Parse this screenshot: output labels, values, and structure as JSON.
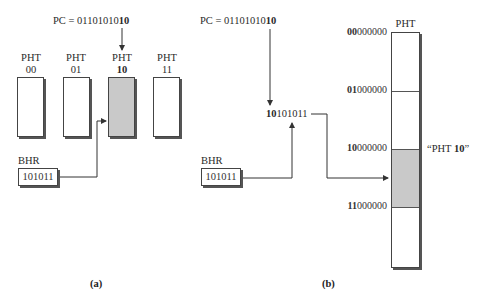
{
  "panel_a": {
    "pc": {
      "prefix": "PC = 01101010",
      "suffix_bold": "10"
    },
    "pht_tables": [
      {
        "label_top": "PHT",
        "label_bottom": "00",
        "bold": false,
        "selected": false
      },
      {
        "label_top": "PHT",
        "label_bottom": "01",
        "bold": false,
        "selected": false
      },
      {
        "label_top": "PHT",
        "label_bottom": "10",
        "bold": true,
        "selected": true
      },
      {
        "label_top": "PHT",
        "label_bottom": "11",
        "bold": false,
        "selected": false
      }
    ],
    "bhr": {
      "label": "BHR",
      "value": "101011"
    },
    "caption": "(a)"
  },
  "panel_b": {
    "pc": {
      "prefix": "PC = 01101010",
      "suffix_bold": "10"
    },
    "index": {
      "bold_prefix": "10",
      "rest": "101011"
    },
    "bhr": {
      "label": "BHR",
      "value": "101011"
    },
    "pht": {
      "label": "PHT",
      "rows": [
        {
          "bold": "00",
          "rest": "000000"
        },
        {
          "bold": "01",
          "rest": "000000"
        },
        {
          "bold": "10",
          "rest": "000000"
        },
        {
          "bold": "11",
          "rest": "000000"
        }
      ],
      "selected_region_label": "“PHT ",
      "selected_region_bold": "10",
      "selected_region_close": "”"
    },
    "caption": "(b)"
  },
  "colors": {
    "selected_fill": "#c9c9c9",
    "line": "#333333"
  }
}
